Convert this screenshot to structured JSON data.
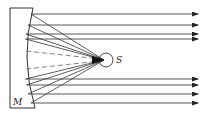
{
  "diagram": {
    "labels": {
      "mirror": "M",
      "source": "S"
    },
    "colors": {
      "stroke": "#333333",
      "dashed": "#777777",
      "background": "#ffffff"
    },
    "source_point": {
      "x": 104,
      "y": 60
    },
    "rays_top_y": [
      14,
      25,
      34,
      39
    ],
    "rays_bottom_y": [
      79,
      85,
      94,
      103
    ],
    "axis_dashed_y": [
      51,
      69
    ]
  }
}
